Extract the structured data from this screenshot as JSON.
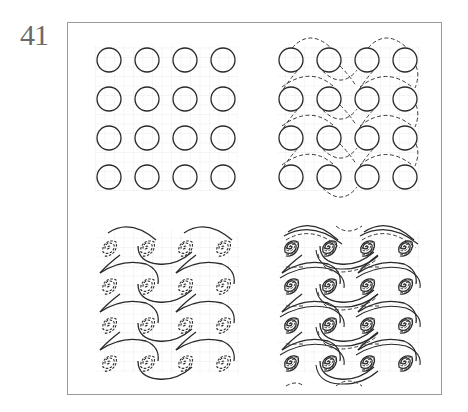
{
  "figure": {
    "number": "41",
    "panels": [
      {
        "id": "step-1",
        "description": "4x4 grid of circles on graph paper"
      },
      {
        "id": "step-2",
        "description": "circles with dashed arcs connecting them"
      },
      {
        "id": "step-3",
        "description": "dashed spirals inside circles joined by solid S-curves"
      },
      {
        "id": "step-4",
        "description": "completed interlocking swirl pattern with echo lines"
      }
    ],
    "grid": {
      "rows": 4,
      "cols": 4,
      "spacing": 38,
      "radius": 12
    },
    "colors": {
      "line": "#2a2a2a",
      "grid": "#e4e4e4",
      "frame": "#9a9a9a",
      "label": "#6a6a6a"
    }
  }
}
